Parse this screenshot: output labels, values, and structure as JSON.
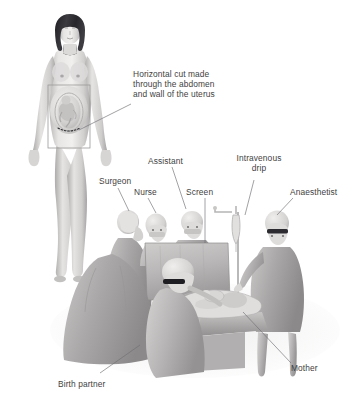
{
  "figure": {
    "type": "medical-illustration",
    "palette": {
      "background": "#ffffff",
      "label_text": "#3f3f42",
      "leader_line": "#6f6f75",
      "skin_light": "#e9e7e6",
      "skin_mid": "#cfcdcc",
      "skin_shadow": "#a9a7a7",
      "hair_dark": "#2b2b2f",
      "gown_light": "#d8d6d5",
      "gown_mid": "#b4b2b2",
      "gown_dark": "#8e8c8d",
      "drape_mid": "#c3c1c1",
      "outline": "#8a8889"
    },
    "labels": [
      {
        "name": "horizontal-cut",
        "lines": [
          "Horizontal cut made",
          "through the abdomen",
          "and wall of the uterus"
        ],
        "text_x": 133,
        "text_y": 69,
        "align": "left",
        "leader": [
          [
            131,
            104
          ],
          [
            79,
            130
          ]
        ]
      },
      {
        "name": "surgeon",
        "lines": [
          "Surgeon"
        ],
        "text_x": 99,
        "text_y": 176,
        "align": "left",
        "leader": [
          [
            118,
            188
          ],
          [
            129,
            211
          ]
        ]
      },
      {
        "name": "nurse",
        "lines": [
          "Nurse"
        ],
        "text_x": 134,
        "text_y": 187,
        "align": "left",
        "leader": [
          [
            148,
            198
          ],
          [
            156,
            213
          ]
        ]
      },
      {
        "name": "assistant",
        "lines": [
          "Assistant"
        ],
        "text_x": 148,
        "text_y": 156,
        "align": "left",
        "leader": [
          [
            172,
            167
          ],
          [
            186,
            209
          ]
        ]
      },
      {
        "name": "screen",
        "lines": [
          "Screen"
        ],
        "text_x": 186,
        "text_y": 187,
        "align": "left",
        "leader": [
          [
            205,
            198
          ],
          [
            205,
            243
          ]
        ]
      },
      {
        "name": "intravenous-drip",
        "lines": [
          "Intravenous",
          "drip"
        ],
        "text_x": 259,
        "text_y": 153,
        "align": "center",
        "leader": [
          [
            254,
            180
          ],
          [
            245,
            215
          ]
        ]
      },
      {
        "name": "anaesthetist",
        "lines": [
          "Anaesthetist"
        ],
        "text_x": 290,
        "text_y": 187,
        "align": "left",
        "leader": [
          [
            293,
            198
          ],
          [
            277,
            215
          ]
        ]
      },
      {
        "name": "birth-partner",
        "lines": [
          "Birth partner"
        ],
        "text_x": 58,
        "text_y": 379,
        "align": "left",
        "leader": [
          [
            100,
            378
          ],
          [
            140,
            345
          ]
        ]
      },
      {
        "name": "mother",
        "lines": [
          "Mother"
        ],
        "text_x": 291,
        "text_y": 370,
        "align": "left",
        "leader": [
          [
            291,
            368
          ],
          [
            243,
            312
          ]
        ]
      }
    ],
    "inset": {
      "name": "abdomen-inset-box",
      "x": 48,
      "y": 85,
      "width": 42,
      "height": 63
    },
    "scene_elements": [
      {
        "name": "standing-pregnant-woman"
      },
      {
        "name": "fetus-in-utero"
      },
      {
        "name": "incision-dotted-line"
      },
      {
        "name": "surgeon-figure"
      },
      {
        "name": "nurse-figure"
      },
      {
        "name": "assistant-figure"
      },
      {
        "name": "anaesthetist-figure"
      },
      {
        "name": "birth-partner-figure"
      },
      {
        "name": "mother-on-table"
      },
      {
        "name": "newborn-baby"
      },
      {
        "name": "surgical-screen-drape"
      },
      {
        "name": "iv-drip-stand"
      },
      {
        "name": "operating-table"
      }
    ]
  }
}
